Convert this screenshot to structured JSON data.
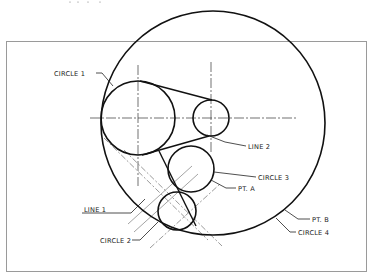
{
  "drawing": {
    "frame": {
      "x": 6,
      "y": 41,
      "width": 361,
      "height": 231,
      "color": "#9a9a9a"
    },
    "circles": [
      {
        "id": "circle-1",
        "label": "CIRCLE 1",
        "cx": 138,
        "cy": 118,
        "r": 37
      },
      {
        "id": "circle-small",
        "label": "",
        "cx": 211,
        "cy": 118,
        "r": 18
      },
      {
        "id": "circle-3",
        "label": "CIRCLE 3",
        "cx": 191,
        "cy": 169,
        "r": 23
      },
      {
        "id": "circle-2",
        "label": "CIRCLE 2",
        "cx": 177,
        "cy": 211,
        "r": 19
      },
      {
        "id": "circle-4",
        "label": "CIRCLE 4",
        "cx": 213,
        "cy": 123,
        "r": 112
      }
    ],
    "labels": {
      "circle1": "CIRCLE 1",
      "line2": "LINE 2",
      "circle3": "CIRCLE 3",
      "pta": "PT. A",
      "line1": "LINE 1",
      "circle2": "CIRCLE 2",
      "ptb": "PT. B",
      "circle4": "CIRCLE 4"
    },
    "stroke_color": "#111111"
  }
}
